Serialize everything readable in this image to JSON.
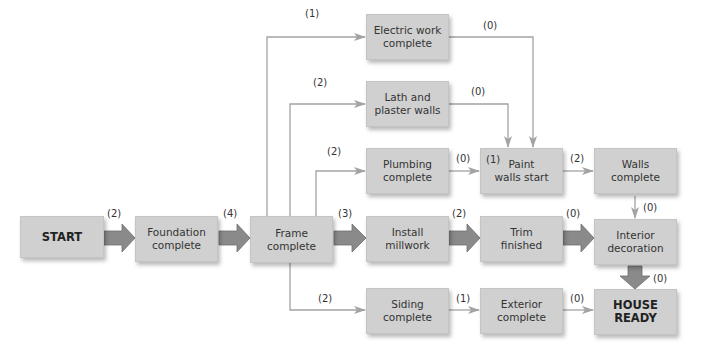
{
  "diagram": {
    "nodes": {
      "start": "START",
      "foundation": "Foundation\ncomplete",
      "frame": "Frame\ncomplete",
      "electric": "Electric work\ncomplete",
      "lath": "Lath and\nplaster walls",
      "plumbing": "Plumbing\ncomplete",
      "millwork": "Install\nmillwork",
      "siding": "Siding\ncomplete",
      "paint": "Paint\nwalls start",
      "paint_prefix": "(1)",
      "trim": "Trim\nfinished",
      "exterior": "Exterior\ncomplete",
      "walls": "Walls\ncomplete",
      "interior": "Interior\ndecoration",
      "house": "HOUSE\nREADY"
    },
    "edges": {
      "start_foundation": "(2)",
      "foundation_frame": "(4)",
      "frame_electric": "(1)",
      "frame_lath": "(2)",
      "frame_plumbing": "(2)",
      "frame_millwork": "(3)",
      "frame_siding": "(2)",
      "electric_paint": "(0)",
      "lath_paint": "(0)",
      "plumbing_paint": "(0)",
      "paint_walls": "(2)",
      "walls_interior": "(0)",
      "millwork_trim": "(2)",
      "trim_interior": "(0)",
      "interior_house": "(0)",
      "siding_exterior": "(1)",
      "exterior_house": "(0)"
    },
    "colors": {
      "box_fill": "#d0d0d0",
      "thick_arrow": "#8a8a8a",
      "thin_line": "#a3a3a3"
    }
  }
}
